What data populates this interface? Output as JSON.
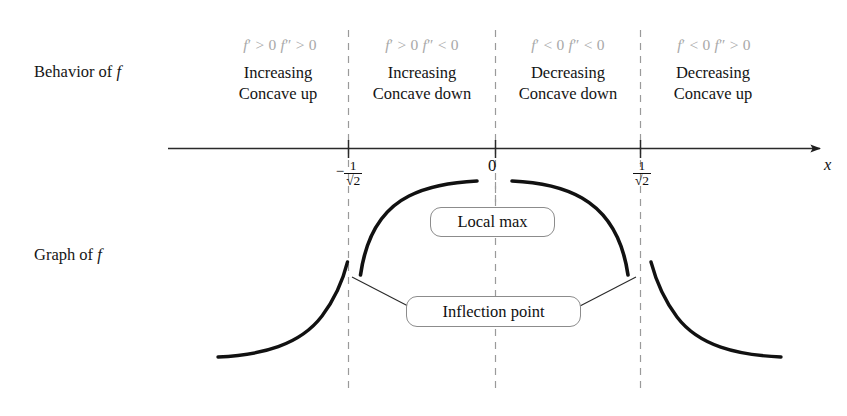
{
  "labels": {
    "behavior_of_f": "Behavior of ",
    "behavior_of_f_sym": "f",
    "graph_of_f": "Graph of ",
    "graph_of_f_sym": "f"
  },
  "axis": {
    "name": "x",
    "zero_label": "0",
    "left_tick": {
      "sign": "−",
      "numerator": "1",
      "denominator": "√2"
    },
    "right_tick": {
      "sign": "",
      "numerator": "1",
      "denominator": "√2"
    },
    "tick_values": [
      "-1/√2",
      "0",
      "1/√2"
    ]
  },
  "regions": [
    {
      "id": "region-1",
      "derivatives": "f′ > 0  f″ > 0",
      "d1": "f′ > 0",
      "d2": "f″ < 0",
      "behavior_line1": "Increasing",
      "behavior_line2": "Concave up"
    },
    {
      "id": "region-2",
      "derivatives": "f′ > 0  f″ < 0",
      "behavior_line1": "Increasing",
      "behavior_line2": "Concave down"
    },
    {
      "id": "region-3",
      "derivatives": "f′ < 0  f″ < 0",
      "behavior_line1": "Decreasing",
      "behavior_line2": "Concave down"
    },
    {
      "id": "region-4",
      "derivatives": "f′ < 0  f″ > 0",
      "behavior_line1": "Decreasing",
      "behavior_line2": "Concave up"
    }
  ],
  "derivative_text": {
    "r1_a": "f",
    "r1_p": "′",
    "r1_b": " > 0 ",
    "r1_c": "f",
    "r1_q": "″",
    "r1_d": " > 0",
    "r2_a": "f",
    "r2_p": "′",
    "r2_b": " > 0 ",
    "r2_c": "f",
    "r2_q": "″",
    "r2_d": " < 0",
    "r3_a": "f",
    "r3_p": "′",
    "r3_b": " < 0 ",
    "r3_c": "f",
    "r3_q": "″",
    "r3_d": " < 0",
    "r4_a": "f",
    "r4_p": "′",
    "r4_b": " < 0 ",
    "r4_c": "f",
    "r4_q": "″",
    "r4_d": " > 0"
  },
  "callouts": {
    "local_max": "Local max",
    "inflection_point": "Inflection point"
  },
  "colors": {
    "curve": "#111111",
    "axis": "#2a2a2a",
    "dashed": "#9a9a9a",
    "derivative_text": "#a9a9a9",
    "callout_border": "#8c8c8c",
    "background": "#ffffff"
  }
}
